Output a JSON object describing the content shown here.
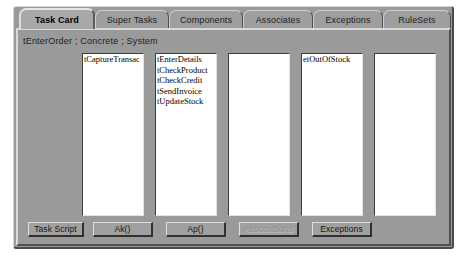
{
  "window": {
    "subtitle": "tEnterOrder ; Concrete ; System"
  },
  "tabs": [
    {
      "label": "Task Card",
      "active": true
    },
    {
      "label": "Super Tasks",
      "active": false
    },
    {
      "label": "Components",
      "active": false
    },
    {
      "label": "Associates",
      "active": false
    },
    {
      "label": "Exceptions",
      "active": false
    },
    {
      "label": "RuleSets",
      "active": false
    }
  ],
  "listboxes": [
    {
      "name": "task-script-list",
      "items": [
        "tCaptureTransac"
      ]
    },
    {
      "name": "ak-list",
      "items": [
        "tEnterDetails",
        "tCheckProduct",
        "tCheckCredit",
        "tSendInvoice",
        "tUpdateStock"
      ]
    },
    {
      "name": "ap-list",
      "items": []
    },
    {
      "name": "associations-list",
      "items": [
        "etOutOfStock"
      ]
    },
    {
      "name": "exceptions-list",
      "items": []
    }
  ],
  "buttons": [
    {
      "label": "Task Script",
      "disabled": false
    },
    {
      "label": "Ak()",
      "disabled": false
    },
    {
      "label": "Ap()",
      "disabled": false
    },
    {
      "label": "Associations",
      "disabled": true
    },
    {
      "label": "Exceptions",
      "disabled": false
    }
  ],
  "colors": {
    "window_face": "#9a9a9a",
    "button_face": "#a0a0a0",
    "list_background": "#ffffff",
    "text": "#000000",
    "disabled_text": "#8c8c8c"
  }
}
